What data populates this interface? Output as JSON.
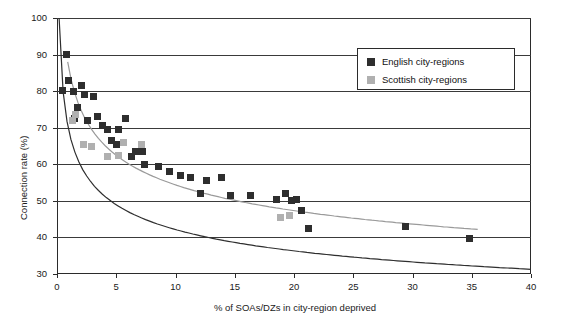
{
  "chart_data": {
    "type": "scatter",
    "title": "",
    "xlabel": "% of SOAs/DZs in city-region deprived",
    "ylabel": "Connection rate (%)",
    "xlim": [
      0,
      40
    ],
    "ylim": [
      30,
      100
    ],
    "xticks": [
      0,
      5,
      10,
      15,
      20,
      25,
      30,
      35,
      40
    ],
    "yticks": [
      30,
      40,
      50,
      60,
      70,
      80,
      90,
      100
    ],
    "grid": "horizontal",
    "legend": {
      "position": "top-right",
      "entries": [
        {
          "label": "English city-regions",
          "color": "#2e2e2e",
          "marker": "square"
        },
        {
          "label": "Scottish city-regions",
          "color": "#b0b0b0",
          "marker": "square"
        }
      ]
    },
    "series": [
      {
        "name": "English city-regions",
        "color": "#2e2e2e",
        "marker": "square",
        "points": [
          [
            0.5,
            80.2
          ],
          [
            0.8,
            90.0
          ],
          [
            1.0,
            83.0
          ],
          [
            1.4,
            80.0
          ],
          [
            1.5,
            72.5
          ],
          [
            1.7,
            75.5
          ],
          [
            2.1,
            81.5
          ],
          [
            2.3,
            79.0
          ],
          [
            2.6,
            72.0
          ],
          [
            3.1,
            78.5
          ],
          [
            3.4,
            73.0
          ],
          [
            3.8,
            70.5
          ],
          [
            4.3,
            69.5
          ],
          [
            4.6,
            66.5
          ],
          [
            5.0,
            65.5
          ],
          [
            5.2,
            69.5
          ],
          [
            5.8,
            72.5
          ],
          [
            6.3,
            62.0
          ],
          [
            6.6,
            63.5
          ],
          [
            7.2,
            63.5
          ],
          [
            7.4,
            60.0
          ],
          [
            8.6,
            59.5
          ],
          [
            9.5,
            58.0
          ],
          [
            10.4,
            57.0
          ],
          [
            11.3,
            56.5
          ],
          [
            12.1,
            52.0
          ],
          [
            12.6,
            55.5
          ],
          [
            13.9,
            56.5
          ],
          [
            14.6,
            51.5
          ],
          [
            16.3,
            51.5
          ],
          [
            18.5,
            50.5
          ],
          [
            19.3,
            52.0
          ],
          [
            19.8,
            50.0
          ],
          [
            20.2,
            50.5
          ],
          [
            20.6,
            47.5
          ],
          [
            21.2,
            42.5
          ],
          [
            29.4,
            43.0
          ],
          [
            34.8,
            39.8
          ]
        ]
      },
      {
        "name": "Scottish city-regions",
        "color": "#b0b0b0",
        "marker": "square",
        "points": [
          [
            1.3,
            72.0
          ],
          [
            1.6,
            73.5
          ],
          [
            2.2,
            65.5
          ],
          [
            2.9,
            65.0
          ],
          [
            4.3,
            62.0
          ],
          [
            5.2,
            62.5
          ],
          [
            5.6,
            66.0
          ],
          [
            7.1,
            65.5
          ],
          [
            18.9,
            45.5
          ],
          [
            19.6,
            46.0
          ]
        ]
      }
    ],
    "trend_lines": [
      {
        "name": "English trend",
        "color": "#2e2e2e"
      },
      {
        "name": "Scottish trend",
        "color": "#9a9a9a"
      }
    ]
  }
}
